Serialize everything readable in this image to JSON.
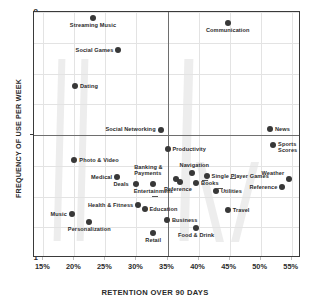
{
  "chart_data": {
    "type": "scatter",
    "title": "",
    "xlabel": "RETENTION OVER 90 DAYS",
    "ylabel": "FREQUENCY OF USE PER WEEK",
    "xlim": [
      13.5,
      56.5
    ],
    "ylim": [
      1,
      9
    ],
    "xticks": [
      "15%",
      "20%",
      "25%",
      "30%",
      "35%",
      "40%",
      "45%",
      "50%",
      "55%"
    ],
    "xtick_values": [
      15,
      20,
      25,
      30,
      35,
      40,
      45,
      50,
      55
    ],
    "yticks": [
      "1",
      "2",
      "3",
      "4",
      "5",
      "6",
      "7",
      "8",
      "9"
    ],
    "ytick_values": [
      1,
      2,
      3,
      4,
      5,
      6,
      7,
      8,
      9
    ],
    "grid": true,
    "legend": "none",
    "quadrant_lines": {
      "x": 35,
      "y": 5
    },
    "points": [
      {
        "label": "Streaming Music",
        "x": 23.0,
        "y": 8.8,
        "lab": "b",
        "dx": 0,
        "dy": 4
      },
      {
        "label": "Communication",
        "x": 44.7,
        "y": 8.65,
        "lab": "b",
        "dx": 0,
        "dy": 4
      },
      {
        "label": "Social Games",
        "x": 27.1,
        "y": 7.78,
        "lab": "l",
        "dx": -5,
        "dy": 0
      },
      {
        "label": "Dating",
        "x": 20.1,
        "y": 6.58,
        "lab": "r",
        "dx": 5,
        "dy": 0
      },
      {
        "label": "Social Networking",
        "x": 33.9,
        "y": 5.15,
        "lab": "l",
        "dx": -5,
        "dy": -1
      },
      {
        "label": "News",
        "x": 51.5,
        "y": 5.18,
        "lab": "r",
        "dx": 5,
        "dy": 0
      },
      {
        "label": "Sports Scores",
        "x": 52.0,
        "y": 4.68,
        "lab": "rw",
        "dx": 5,
        "dy": 2
      },
      {
        "label": "Productivity",
        "x": 35.0,
        "y": 4.55,
        "lab": "r",
        "dx": 5,
        "dy": 0
      },
      {
        "label": "Photo & Video",
        "x": 20.0,
        "y": 4.18,
        "lab": "r",
        "dx": 5,
        "dy": 0
      },
      {
        "label": "Navigation",
        "x": 39.0,
        "y": 3.75,
        "lab": "t",
        "dx": 2,
        "dy": -5
      },
      {
        "label": "Banking & Payments",
        "x": 36.4,
        "y": 3.58,
        "lab": "lw",
        "dx": -12,
        "dy": -9
      },
      {
        "label": "Medical",
        "x": 26.9,
        "y": 3.62,
        "lab": "l",
        "dx": -5,
        "dy": 0
      },
      {
        "label": "Single Player Games",
        "x": 41.3,
        "y": 3.68,
        "lab": "r",
        "dx": 5,
        "dy": 0
      },
      {
        "label": "Weather",
        "x": 54.6,
        "y": 3.58,
        "lab": "l",
        "dx": -5,
        "dy": -6
      },
      {
        "label": "Deals",
        "x": 29.9,
        "y": 3.42,
        "lab": "l",
        "dx": -7,
        "dy": 0
      },
      {
        "label": "Books",
        "x": 39.6,
        "y": 3.45,
        "lab": "r",
        "dx": 5,
        "dy": 0
      },
      {
        "label": "Entertainment",
        "x": 32.7,
        "y": 3.4,
        "lab": "b",
        "dx": 0,
        "dy": 4
      },
      {
        "label": "Reference",
        "x": 37.0,
        "y": 3.48,
        "lab": "b",
        "dx": -2,
        "dy": 4
      },
      {
        "label": "Reference ",
        "x": 53.5,
        "y": 3.32,
        "lab": "l",
        "dx": -5,
        "dy": 0
      },
      {
        "label": "Utilities",
        "x": 42.8,
        "y": 3.18,
        "lab": "r",
        "dx": 5,
        "dy": 0
      },
      {
        "label": "Health & Fitness",
        "x": 30.3,
        "y": 2.72,
        "lab": "l",
        "dx": -5,
        "dy": 0
      },
      {
        "label": "Education",
        "x": 31.3,
        "y": 2.58,
        "lab": "r",
        "dx": 5,
        "dy": 0
      },
      {
        "label": "Travel",
        "x": 44.7,
        "y": 2.55,
        "lab": "r",
        "dx": 5,
        "dy": 0
      },
      {
        "label": "Music",
        "x": 19.6,
        "y": 2.42,
        "lab": "l",
        "dx": -5,
        "dy": 0
      },
      {
        "label": "Business",
        "x": 34.9,
        "y": 2.25,
        "lab": "r",
        "dx": 5,
        "dy": 0
      },
      {
        "label": "Personalization",
        "x": 22.4,
        "y": 2.18,
        "lab": "b",
        "dx": 0,
        "dy": 4
      },
      {
        "label": "Food & Drink",
        "x": 39.6,
        "y": 1.96,
        "lab": "b",
        "dx": 0,
        "dy": 4
      },
      {
        "label": "Retail",
        "x": 32.7,
        "y": 1.82,
        "lab": "b",
        "dx": 0,
        "dy": 4
      }
    ]
  },
  "axis": {
    "y_title": "FREQUENCY OF USE PER WEEK",
    "x_title": "RETENTION OVER 90 DAYS"
  }
}
